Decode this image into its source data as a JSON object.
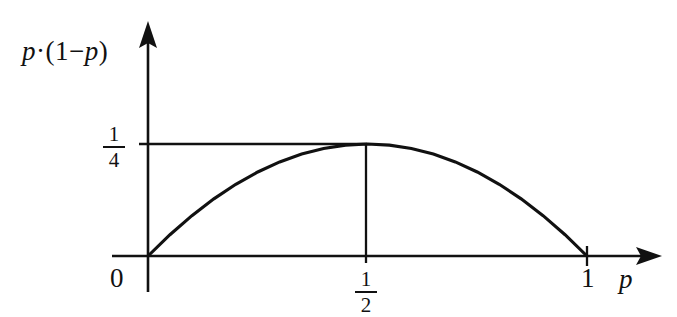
{
  "figure": {
    "kind": "math-plot",
    "background_color": "#ffffff",
    "ink_color": "#111111"
  },
  "axes": {
    "x_axis": {
      "label": "p",
      "label_name": "x-axis-label",
      "arrow": true,
      "origin_px": 148,
      "tick_labels": [
        "0",
        "1"
      ],
      "fraction_tick": {
        "numerator": "1",
        "denominator": "2"
      }
    },
    "y_axis": {
      "label_parts": {
        "p_first": "p",
        "dot": "·",
        "open": "(",
        "one": "1",
        "minus": "−",
        "p_second": "p",
        "close": ")"
      },
      "label_plain": "p · (1 − p)",
      "arrow": true,
      "fraction_tick": {
        "numerator": "1",
        "denominator": "4"
      }
    }
  },
  "chart_data": {
    "type": "line",
    "title": "",
    "xlabel": "p",
    "ylabel": "p · (1 - p)",
    "xlim": [
      0,
      1.18
    ],
    "ylim": [
      0,
      0.3
    ],
    "grid": false,
    "legend": null,
    "x_tick_values": [
      0,
      0.5,
      1
    ],
    "x_tick_labels": [
      "0",
      "1/2",
      "1"
    ],
    "y_tick_values": [
      0.25
    ],
    "y_tick_labels": [
      "1/4"
    ],
    "annotations": [
      {
        "name": "peak-guide-horizontal",
        "from": [
          0,
          0.25
        ],
        "to": [
          0.5,
          0.25
        ]
      },
      {
        "name": "peak-guide-vertical",
        "from": [
          0.5,
          0
        ],
        "to": [
          0.5,
          0.25
        ]
      }
    ],
    "series": [
      {
        "name": "p(1-p)",
        "formula": "y = p * (1 - p)",
        "x": [
          0.0,
          0.05,
          0.1,
          0.15,
          0.2,
          0.25,
          0.3,
          0.35,
          0.4,
          0.45,
          0.5,
          0.55,
          0.6,
          0.65,
          0.7,
          0.75,
          0.8,
          0.85,
          0.9,
          0.95,
          1.0
        ],
        "values": [
          0.0,
          0.0475,
          0.09,
          0.1275,
          0.16,
          0.1875,
          0.21,
          0.2275,
          0.24,
          0.2475,
          0.25,
          0.2475,
          0.24,
          0.2275,
          0.21,
          0.1875,
          0.16,
          0.1275,
          0.09,
          0.0475,
          0.0
        ]
      }
    ]
  }
}
